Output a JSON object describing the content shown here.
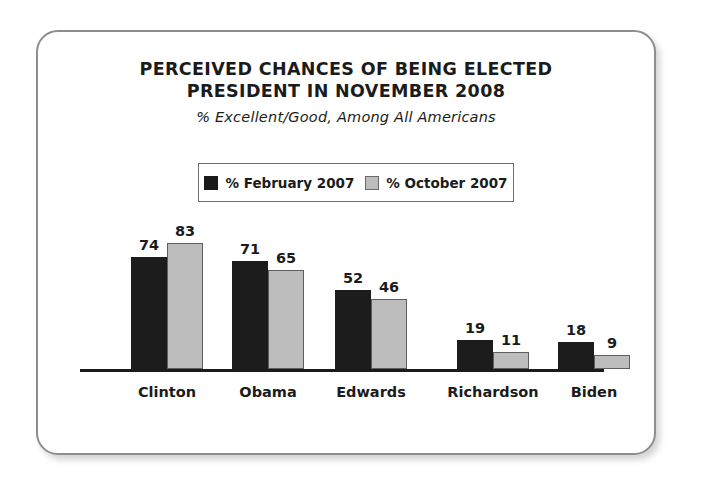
{
  "chart_data": {
    "type": "bar",
    "title": "PERCEIVED CHANCES OF BEING ELECTED PRESIDENT IN NOVEMBER 2008",
    "title_line1": "PERCEIVED CHANCES OF BEING ELECTED",
    "title_line2": "PRESIDENT IN NOVEMBER 2008",
    "subtitle": "% Excellent/Good, Among All Americans",
    "categories": [
      "Clinton",
      "Obama",
      "Edwards",
      "Richardson",
      "Biden"
    ],
    "series": [
      {
        "name": "% February 2007",
        "color": "#1c1c1c",
        "values": [
          74,
          71,
          52,
          19,
          18
        ]
      },
      {
        "name": "% October 2007",
        "color": "#bdbdbd",
        "values": [
          83,
          65,
          46,
          11,
          9
        ]
      }
    ],
    "xlabel": "",
    "ylabel": "",
    "ylim": [
      0,
      100
    ],
    "grid": false,
    "axis_visible": "x-only",
    "legend_position": "top-center",
    "data_labels": true
  },
  "legend": {
    "items": [
      {
        "label": "% February 2007",
        "swatch": "dark-swatch-icon"
      },
      {
        "label": "% October 2007",
        "swatch": "light-swatch-icon"
      }
    ]
  },
  "colors": {
    "series_1": "#1c1c1c",
    "series_2": "#bdbdbd",
    "text": "#1b1b1b",
    "card_border": "#8d8d8d",
    "axis": "#1b1b1b",
    "background": "#ffffff"
  }
}
